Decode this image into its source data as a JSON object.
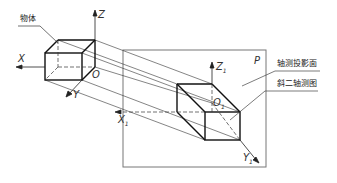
{
  "diagram": {
    "type": "oblique axonometric projection illustration",
    "labels": {
      "object": "物体",
      "projection_plane": "轴测投影面",
      "oblique_drawing": "斜二轴测图",
      "plane_name": "P"
    },
    "axes_original": {
      "x": "X",
      "y": "Y",
      "z": "Z",
      "origin": "O"
    },
    "axes_projected": {
      "x": "X",
      "y": "Y",
      "z": "Z",
      "origin": "O",
      "subscript": "1"
    },
    "colors": {
      "line": "#222222",
      "frame": "#666666",
      "background": "#ffffff"
    }
  }
}
